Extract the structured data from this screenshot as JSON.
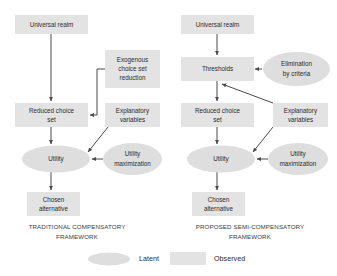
{
  "figure": {
    "type": "flow-diagram",
    "background_color": "#ffffff",
    "shape_fill_observed": "#e3e3e3",
    "shape_fill_latent": "#dedede",
    "connector_color": "#4a4a4a",
    "text_color": "#2b2b2b"
  },
  "left_panel": {
    "caption_line1": "TRADITIONAL COMPENSATORY",
    "caption_line2": "FRAMEWORK",
    "nodes": {
      "universal_realm": "Universal realm",
      "exogenous_reduction_line1": "Exogenous",
      "exogenous_reduction_line2": "choice set",
      "exogenous_reduction_line3": "reduction",
      "reduced_choice_line1": "Reduced choice",
      "reduced_choice_line2": "set",
      "explanatory_line1": "Explanatory",
      "explanatory_line2": "variables",
      "utility": "Utility",
      "utility_max_line1": "Utility",
      "utility_max_line2": "maximization",
      "chosen_line1": "Chosen",
      "chosen_line2": "alternative"
    }
  },
  "right_panel": {
    "caption_line1": "PROPOSED SEMI-COMPENSATORY",
    "caption_line2": "FRAMEWORK",
    "nodes": {
      "universal_realm": "Universal realm",
      "thresholds": "Thresholds",
      "elimination_line1": "Elimination",
      "elimination_line2": "by criteria",
      "reduced_choice_line1": "Reduced choice",
      "reduced_choice_line2": "set",
      "explanatory_line1": "Explanatory",
      "explanatory_line2": "variables",
      "utility": "Utility",
      "utility_max_line1": "Utility",
      "utility_max_line2": "maximization",
      "chosen_line1": "Chosen",
      "chosen_line2": "alternative"
    }
  },
  "legend": {
    "latent_label": "Latent",
    "observed_label": "Observed"
  }
}
